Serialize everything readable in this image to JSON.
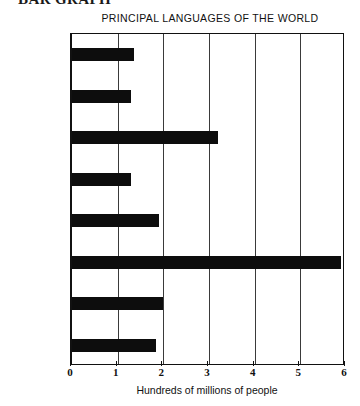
{
  "section_heading": "BAR GRAPH",
  "chart_data": {
    "type": "bar",
    "orientation": "horizontal",
    "title": "PRINCIPAL LANGUAGES OF THE WORLD",
    "xlabel": "Hundreds of millions of people",
    "ylabel": "",
    "xlim": [
      0,
      6
    ],
    "xticks": [
      0,
      1,
      2,
      3,
      4,
      5,
      6
    ],
    "xtick_labels": [
      "0",
      "1",
      "2",
      "3",
      "4",
      "5",
      "6"
    ],
    "grid": true,
    "grid_axis": "x",
    "legend": false,
    "bar_color": "#0d0d0d",
    "categories": [
      "Arabic",
      "Bengali",
      "English",
      "German",
      "Hindi",
      "Mandarin\n(Chinese)",
      "Russian",
      "Spanish"
    ],
    "values": [
      1.35,
      1.3,
      3.2,
      1.3,
      1.9,
      5.9,
      2.0,
      1.85
    ]
  }
}
